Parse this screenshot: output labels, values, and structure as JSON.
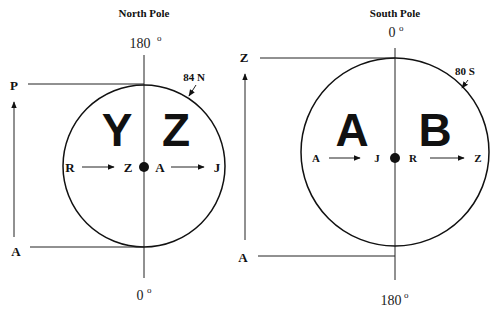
{
  "north": {
    "title": "North Pole",
    "top_degree": "180",
    "bottom_degree": "0",
    "degree_symbol": "o",
    "latitude_label": "84 N",
    "quadrant_left": "Y",
    "quadrant_right": "Z",
    "axis_top_label": "P",
    "axis_bottom_label": "A",
    "flow_left_start": "R",
    "flow_left_end": "Z",
    "flow_right_start": "A",
    "flow_right_end": "J"
  },
  "south": {
    "title": "South Pole",
    "top_degree": "0",
    "bottom_degree": "180",
    "degree_symbol": "o",
    "latitude_label": "80 S",
    "quadrant_left": "A",
    "quadrant_right": "B",
    "axis_top_label": "Z",
    "axis_bottom_label": "A",
    "flow_left_start": "A",
    "flow_left_end": "J",
    "flow_right_start": "R",
    "flow_right_end": "Z"
  },
  "colors": {
    "ink": "#111111",
    "background": "#ffffff"
  }
}
